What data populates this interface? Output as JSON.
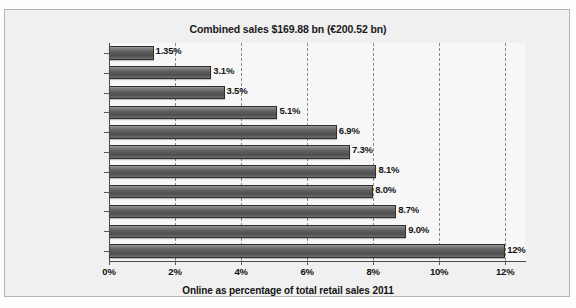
{
  "clipped_caption_above": "",
  "chart_data": {
    "type": "bar",
    "orientation": "horizontal",
    "title": "Combined sales $169.88 bn (€200.52 bn)",
    "xlabel": "Online as percentage of total retail sales 2011",
    "ylabel": "",
    "xlim": [
      0,
      12.6
    ],
    "xticks": [
      "0%",
      "2%",
      "4%",
      "6%",
      "8%",
      "10%",
      "12%"
    ],
    "xtick_values": [
      0,
      2,
      4,
      6,
      8,
      10,
      12
    ],
    "grid": "vertical-dashed",
    "legend": "none",
    "categories": [
      "Italy",
      "Poland",
      "Spain",
      "Benelux (NL, B, Lux)",
      "Sweden",
      "France",
      "Norway",
      "Denmark",
      "Switzerland",
      "Germany",
      "UK"
    ],
    "values": [
      1.35,
      3.1,
      3.5,
      5.1,
      6.9,
      7.3,
      8.1,
      8.0,
      8.7,
      9.0,
      12.0
    ],
    "data_labels": [
      "1.35%",
      "3.1%",
      "3.5%",
      "5.1%",
      "6.9%",
      "7.3%",
      "8.1%",
      "8.0%",
      "8.7%",
      "9.0%",
      "12%"
    ],
    "colors": {
      "bar_fill_top": "#9a9a9a",
      "bar_fill_bottom": "#4e4e4e",
      "bar_border": "#2e2e2e",
      "plot_background": "#f7f7f7",
      "frame_background": "#f0f0f0",
      "frame_border": "#b4b4b4",
      "gridline": "#8a8a8a",
      "text": "#101010"
    }
  }
}
